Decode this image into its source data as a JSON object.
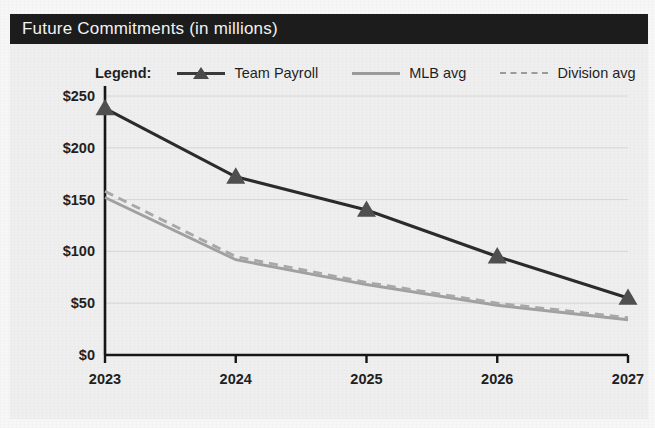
{
  "header": {
    "title": "Future Commitments (in millions)"
  },
  "legend": {
    "title": "Legend:",
    "items": [
      {
        "label": "Team Payroll",
        "style": "solid-triangle",
        "color": "#2b2b2b"
      },
      {
        "label": "MLB avg",
        "style": "solid",
        "color": "#a0a0a0"
      },
      {
        "label": "Division avg",
        "style": "dashed",
        "color": "#a8a8a8"
      }
    ]
  },
  "chart_data": {
    "type": "line",
    "title": "Future Commitments (in millions)",
    "xlabel": "",
    "ylabel": "",
    "categories": [
      "2023",
      "2024",
      "2025",
      "2026",
      "2027"
    ],
    "x": [
      2023,
      2024,
      2025,
      2026,
      2027
    ],
    "ylim": [
      0,
      250
    ],
    "ytick_values": [
      0,
      50,
      100,
      150,
      200,
      250
    ],
    "ytick_labels": [
      "$0",
      "$50",
      "$100",
      "$150",
      "$200",
      "$250"
    ],
    "xtick_labels": [
      "2023",
      "2024",
      "2025",
      "2026",
      "2027"
    ],
    "grid": true,
    "legend_position": "top",
    "series": [
      {
        "name": "Team Payroll",
        "values": [
          238,
          172,
          140,
          95,
          55
        ],
        "color": "#2b2b2b",
        "style": "solid",
        "marker": "triangle"
      },
      {
        "name": "MLB avg",
        "values": [
          152,
          92,
          68,
          48,
          34
        ],
        "color": "#a0a0a0",
        "style": "solid",
        "marker": "none"
      },
      {
        "name": "Division avg",
        "values": [
          158,
          95,
          70,
          50,
          36
        ],
        "color": "#a8a8a8",
        "style": "dashed",
        "marker": "none"
      }
    ]
  }
}
